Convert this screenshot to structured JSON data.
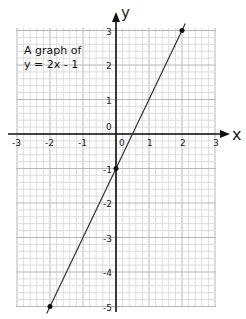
{
  "chart_data": {
    "type": "line",
    "title_lines": [
      "A graph of",
      "y = 2× - 1"
    ],
    "xlabel": "x",
    "ylabel": "y",
    "xlim": [
      -3,
      3
    ],
    "ylim": [
      -5,
      3
    ],
    "x_ticks": [
      -3,
      -2,
      -1,
      0,
      1,
      2,
      3
    ],
    "y_ticks": [
      -5,
      -4,
      -3,
      -2,
      -1,
      0,
      1,
      2,
      3
    ],
    "grid": true,
    "series": [
      {
        "name": "y = 2x - 1",
        "x": [
          -2,
          0,
          2
        ],
        "y": [
          -5,
          -1,
          3
        ],
        "marked_points": [
          [
            -2,
            -5
          ],
          [
            0,
            -1
          ],
          [
            2,
            3
          ]
        ],
        "color": "#333333"
      }
    ]
  },
  "labels": {
    "title_line1": "A graph of",
    "title_line2": "y = 2х - 1",
    "x_axis": "x",
    "y_axis": "y"
  },
  "colors": {
    "grid_minor": "#dcdcdc",
    "grid_major": "#b8b8b8",
    "axis": "#111111",
    "line": "#333333"
  }
}
